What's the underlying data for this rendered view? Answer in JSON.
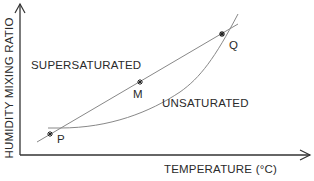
{
  "diagram": {
    "axes": {
      "x_label": "TEMPERATURE (°C)",
      "y_label": "HUMIDITY MIXING RATIO"
    },
    "regions": {
      "upper": "SUPERSATURATED",
      "lower": "UNSATURATED"
    },
    "points": [
      {
        "id": "P",
        "label": "P"
      },
      {
        "id": "M",
        "label": "M"
      },
      {
        "id": "Q",
        "label": "Q"
      }
    ],
    "colors": {
      "axis": "#333333",
      "curve": "#777777",
      "text": "#2a2a2a"
    }
  }
}
